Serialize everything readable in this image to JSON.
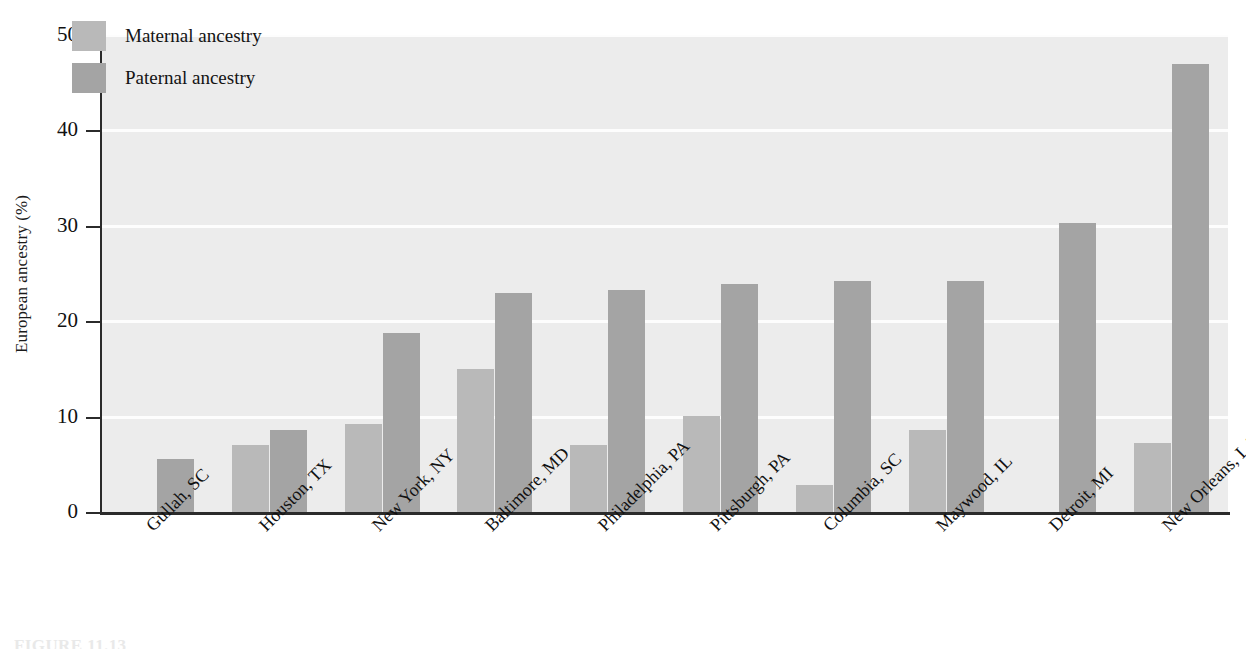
{
  "chart_data": {
    "type": "bar",
    "title": "",
    "xlabel": "",
    "ylabel": "European ancestry (%)",
    "ylim": [
      0,
      50
    ],
    "yticks": [
      "0",
      "10",
      "20",
      "30",
      "40",
      "50"
    ],
    "grid": true,
    "legend_position": "top-left",
    "categories": [
      "Gullah, SC",
      "Houston, TX",
      "New York, NY",
      "Baltimore, MD",
      "Philadelphia, PA",
      "Pittsburgh, PA",
      "Columbia, SC",
      "Maywood, IL",
      "Detroit, MI",
      "New Orleans, LA"
    ],
    "series": [
      {
        "name": "Maternal ancestry",
        "color": "#b9b9b9",
        "values": [
          null,
          7.0,
          9.2,
          15.0,
          7.0,
          10.1,
          2.8,
          8.6,
          null,
          7.2
        ]
      },
      {
        "name": "Paternal ancestry",
        "color": "#a4a4a4",
        "values": [
          5.6,
          8.6,
          18.8,
          23.0,
          23.3,
          23.9,
          24.2,
          24.2,
          30.3,
          47.0
        ]
      }
    ]
  },
  "caption": {
    "text": "FIGURE 11.13"
  }
}
